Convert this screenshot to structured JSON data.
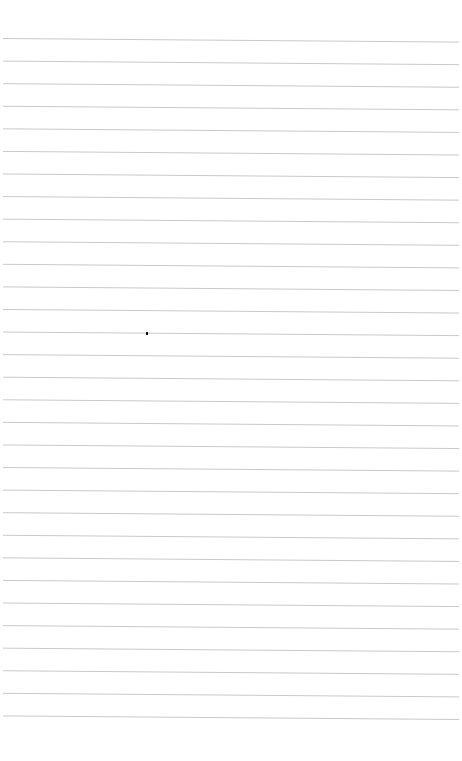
{
  "paper": {
    "type": "lined-paper",
    "background_color": "#ffffff",
    "line_color": "#c9c9c9",
    "line_count": 31,
    "first_line_y_left": 38.5,
    "line_spacing": 22.58,
    "line_slope_px": 3.6,
    "line_x_start": 3,
    "line_x_end": 459
  },
  "marks": [
    {
      "kind": "dot",
      "x": 146,
      "y": 332,
      "color": "#111111"
    }
  ]
}
